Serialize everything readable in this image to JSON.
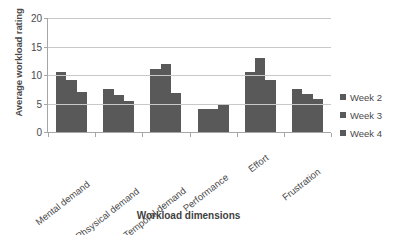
{
  "chart_data": {
    "type": "bar",
    "title": "",
    "xlabel": "Workload dimensions",
    "ylabel": "Average workload rating",
    "categories": [
      "Mental demand",
      "Phsysical demand",
      "Temporal demand",
      "Performance",
      "Effort",
      "Frustration"
    ],
    "series": [
      {
        "name": "Week 2",
        "color": "#595959",
        "values": [
          10.5,
          7.5,
          11.1,
          4.0,
          10.6,
          7.5
        ]
      },
      {
        "name": "Week 3",
        "color": "#595959",
        "values": [
          9.1,
          6.5,
          12.0,
          4.0,
          13.0,
          6.6
        ]
      },
      {
        "name": "Week 4",
        "color": "#595959",
        "values": [
          7.0,
          5.4,
          6.8,
          4.7,
          9.2,
          5.8
        ]
      }
    ],
    "ylim": [
      0,
      20
    ],
    "yticks": [
      0,
      5,
      10,
      15,
      20
    ],
    "ytick_labels": [
      "0",
      "5",
      "10",
      "15",
      "20"
    ],
    "grid": true,
    "legend_position": "right",
    "legend_marker": "square-swatch-icon"
  }
}
